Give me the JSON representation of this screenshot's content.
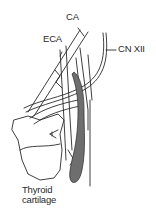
{
  "diagram": {
    "type": "anatomical-line-drawing",
    "labels": {
      "ca": "CA",
      "eca": "ECA",
      "cn_xii": "CN XII",
      "thyroid_line1": "Thyroid",
      "thyroid_line2": "cartilage"
    },
    "colors": {
      "line": "#2a2a2a",
      "shaded_structure": "#6e6e6e",
      "background": "#ffffff"
    }
  }
}
